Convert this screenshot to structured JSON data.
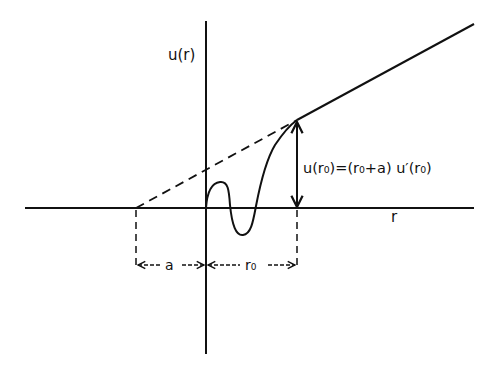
{
  "diagram": {
    "title": "",
    "y_axis_label": "u(r)",
    "x_axis_label": "r",
    "equation_label": "u(r₀)=(r₀+a) u′(r₀)",
    "dimension_a_label": "a",
    "dimension_r0_label": "r₀",
    "colors": {
      "ink": "#111111",
      "background": "#ffffff"
    },
    "elements": [
      "horizontal axis (r)",
      "vertical axis u(r)",
      "wave function curve u(r)",
      "asymptotic straight line (solid beyond r0)",
      "dashed extrapolation to r = -a",
      "vertical arrow marking u(r0)",
      "dimension arrows for a and r0"
    ]
  }
}
